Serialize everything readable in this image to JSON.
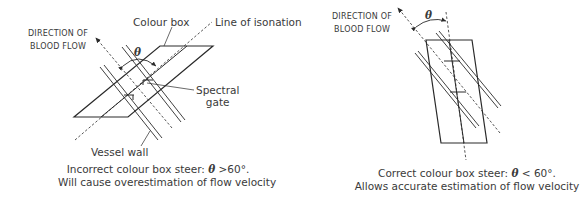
{
  "left_panel": {
    "direction_label_line1": "Direction of",
    "direction_label_line2": "blood flow",
    "colour_box_label": "Colour box",
    "isonation_label": "Line of isonation",
    "spectral_gate_line1": "Spectral",
    "spectral_gate_line2": "gate",
    "vessel_wall_label": "Vessel wall",
    "theta_symbol": "θ",
    "caption_line1_prefix": "Incorrect colour box steer: ",
    "caption_line1_theta": "θ",
    "caption_line1_suffix": " >60°.",
    "caption_line2": "Will cause overestimation of flow velocity"
  },
  "right_panel": {
    "direction_label_line1": "Direction of",
    "direction_label_line2": "blood flow",
    "theta_symbol": "θ",
    "caption_line1_prefix": "Correct colour box steer: ",
    "caption_line1_theta": "θ",
    "caption_line1_suffix": " < 60°.",
    "caption_line2": "Allows accurate estimation of flow velocity"
  },
  "colors": {
    "line": "#2a2a2a",
    "text": "#3a3a3a"
  }
}
